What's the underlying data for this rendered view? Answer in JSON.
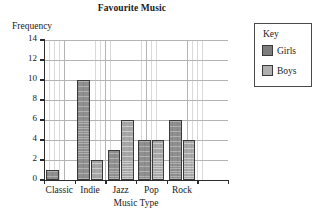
{
  "chart_data": {
    "type": "bar",
    "title": "Favourite Music",
    "xlabel": "Music Type",
    "ylabel": "Frequency",
    "categories": [
      "Classic",
      "Indie",
      "Jazz",
      "Pop",
      "Rock"
    ],
    "series": [
      {
        "name": "Girls",
        "color": "#8f8f8f",
        "values": [
          1,
          10,
          3,
          4,
          6
        ]
      },
      {
        "name": "Boys",
        "color": "#a8a8a8",
        "values": [
          0,
          2,
          6,
          4,
          4
        ]
      }
    ],
    "ylim": [
      0,
      14
    ],
    "ytick_labels": [
      "0",
      "2",
      "4",
      "6",
      "8",
      "10",
      "12",
      "14"
    ],
    "ytick_values": [
      0,
      2,
      4,
      6,
      8,
      10,
      12,
      14
    ],
    "grid": true,
    "grid_minor": true,
    "legend_position": "right-outside"
  },
  "legend": {
    "title": "Key",
    "entries": [
      {
        "label": "Girls",
        "color": "#7d7d7d"
      },
      {
        "label": "Boys",
        "color": "#b0b0b0"
      }
    ]
  }
}
